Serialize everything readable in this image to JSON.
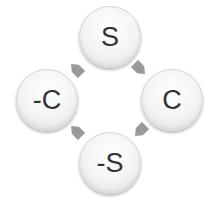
{
  "diagram": {
    "type": "cycle",
    "nodes": [
      {
        "id": "s",
        "label": "S"
      },
      {
        "id": "c",
        "label": "C"
      },
      {
        "id": "neg-s",
        "label": "-S"
      },
      {
        "id": "neg-c",
        "label": "-C"
      }
    ],
    "edges": [
      {
        "from": "S",
        "to": "C"
      },
      {
        "from": "C",
        "to": "-S"
      },
      {
        "from": "-S",
        "to": "-C"
      },
      {
        "from": "-C",
        "to": "S"
      }
    ],
    "colors": {
      "node_fill": "#f3f3f3",
      "node_text": "#333333",
      "arrow": "#999999"
    }
  }
}
